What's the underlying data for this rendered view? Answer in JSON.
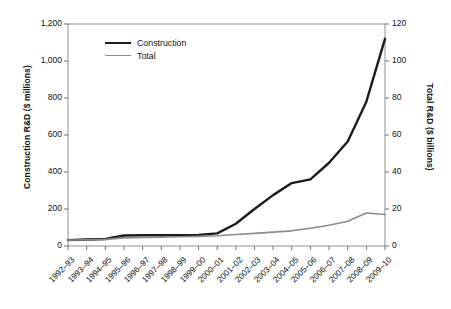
{
  "chart_data": {
    "type": "line",
    "title": "",
    "xlabel": "",
    "categories": [
      "1992–93",
      "1993–94",
      "1994–95",
      "1995–96",
      "1996–97",
      "1997–98",
      "1998–99",
      "1999–00",
      "2000–01",
      "2001–02",
      "2002–03",
      "2003–04",
      "2004–05",
      "2005–06",
      "2006–07",
      "2007–08",
      "2008–09",
      "2009–10"
    ],
    "series": [
      {
        "name": "Construction",
        "axis": "left",
        "unit": "$ millions",
        "color": "#1c1c1c",
        "values": [
          32,
          35,
          38,
          57,
          58,
          58,
          59,
          60,
          68,
          120,
          200,
          275,
          340,
          360,
          450,
          565,
          780,
          1120
        ]
      },
      {
        "name": "Total",
        "axis": "right",
        "unit": "$ billions",
        "color": "#8a8a8a",
        "values": [
          3.2,
          3.4,
          3.6,
          4.4,
          4.6,
          4.8,
          5.0,
          5.2,
          5.5,
          6.2,
          6.8,
          7.5,
          8.2,
          9.6,
          11.2,
          13.4,
          17.8,
          17.0
        ]
      }
    ],
    "left_axis": {
      "label": "Construction R&D ($ millions)",
      "ticks": [
        "0",
        "200",
        "400",
        "600",
        "800",
        "1,000",
        "1,200"
      ],
      "tick_values": [
        0,
        200,
        400,
        600,
        800,
        1000,
        1200
      ],
      "ylim": [
        0,
        1200
      ]
    },
    "right_axis": {
      "label": "Total R&D ($ billions)",
      "ticks": [
        "0",
        "20",
        "40",
        "60",
        "80",
        "100",
        "120"
      ],
      "tick_values": [
        0,
        20,
        40,
        60,
        80,
        100,
        120
      ],
      "ylim": [
        0,
        120
      ]
    },
    "legend": {
      "position": "top-left-inside",
      "entries": [
        "Construction",
        "Total"
      ]
    },
    "grid": false
  }
}
